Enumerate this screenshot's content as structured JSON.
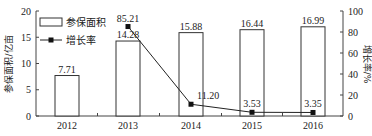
{
  "chart_data": {
    "type": "bar+line",
    "categories": [
      "2012",
      "2013",
      "2014",
      "2015",
      "2016"
    ],
    "series": [
      {
        "name": "参保面积",
        "type": "bar",
        "axis": "left",
        "values": [
          7.71,
          14.28,
          15.88,
          16.44,
          16.99
        ],
        "labels": [
          "7.71",
          "14.28",
          "15.88",
          "16.44",
          "16.99"
        ]
      },
      {
        "name": "增长率",
        "type": "line",
        "axis": "right",
        "values": [
          null,
          85.21,
          11.2,
          3.53,
          3.35
        ],
        "labels": [
          "",
          "85.21",
          "11.20",
          "3.53",
          "3.35"
        ]
      }
    ],
    "ylabel_left": "参保面积/亿亩",
    "ylabel_right": "增长率/%",
    "ylim_left": [
      0,
      20
    ],
    "ylim_right": [
      0,
      100
    ],
    "yticks_left": [
      "0",
      "5",
      "10",
      "15",
      "20"
    ],
    "yticks_right": [
      "0",
      "20",
      "40",
      "60",
      "80",
      "100"
    ],
    "legend": [
      "参保面积",
      "增长率"
    ],
    "legend_position": "upper-left",
    "grid": false
  }
}
